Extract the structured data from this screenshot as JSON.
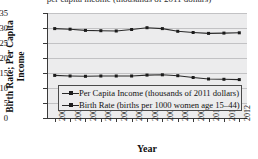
{
  "figure": {
    "cropped_title_fragment": "per capita income (thousands of 2011 dollars)"
  },
  "chart_data": {
    "type": "line",
    "title": "",
    "xlabel": "Year",
    "ylabel": "Birth Rate; Per Capita\nIncome",
    "categories": [
      "2000",
      "2001",
      "2002",
      "2003",
      "2004",
      "2005",
      "2006",
      "2007",
      "2008",
      "2009",
      "2010",
      "2011",
      "2012"
    ],
    "ylim": [
      0,
      35
    ],
    "yticks": [
      0,
      5,
      10,
      15,
      20,
      25,
      30,
      35
    ],
    "grid": true,
    "legend_position": "lower-left-inside",
    "series": [
      {
        "name": "Per Capita Income (thousands of 2011 dollars)",
        "values": [
          29.8,
          29.6,
          29.2,
          29.1,
          29.0,
          29.5,
          30.1,
          29.8,
          28.9,
          28.5,
          28.2,
          28.3,
          28.4
        ]
      },
      {
        "name": "Birth Rate (births per 1000 women age 15–44)",
        "values": [
          14.2,
          14.0,
          13.9,
          14.0,
          14.0,
          14.0,
          14.3,
          14.4,
          14.1,
          13.5,
          13.0,
          12.9,
          12.8
        ]
      }
    ]
  },
  "colors": {
    "plot_background": "#ececed",
    "gridline": "#c2c2c4",
    "axis": "#3a3a3a",
    "series_line": "#2a2a2a",
    "marker": "#1c1c1c",
    "page_background": "#ffffff"
  }
}
